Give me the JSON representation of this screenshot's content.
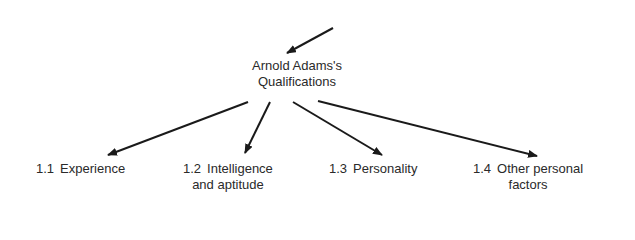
{
  "diagram": {
    "type": "hierarchy-tree",
    "root": {
      "label_line1": "Arnold Adams's",
      "label_line2": "Qualifications",
      "incoming_arrow": true
    },
    "children": [
      {
        "number": "1.1",
        "label_line1": "Experience",
        "label_line2": ""
      },
      {
        "number": "1.2",
        "label_line1": "Intelligence",
        "label_line2": "and aptitude"
      },
      {
        "number": "1.3",
        "label_line1": "Personality",
        "label_line2": ""
      },
      {
        "number": "1.4",
        "label_line1": "Other personal",
        "label_line2": "factors"
      }
    ],
    "colors": {
      "line": "#1a1a1a",
      "text": "#2a2a2a",
      "background": "#ffffff"
    }
  }
}
